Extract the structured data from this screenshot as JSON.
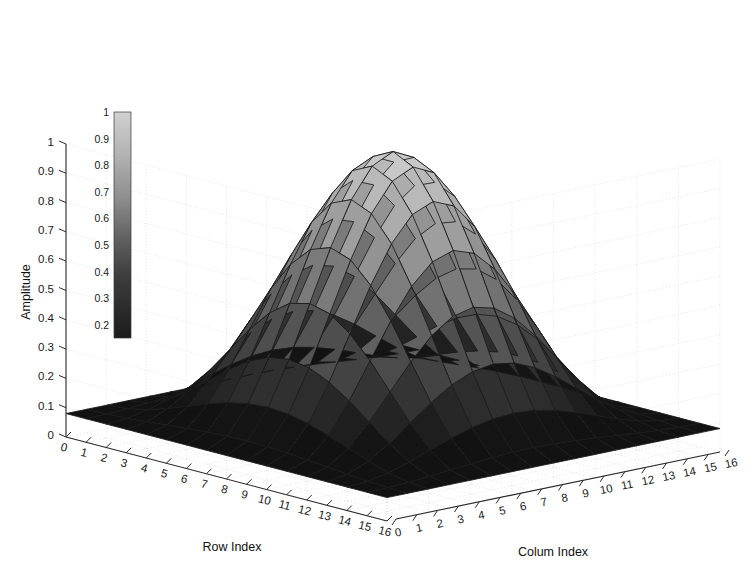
{
  "chart_data": {
    "type": "surface",
    "title": "",
    "xlabel": "Row Index",
    "ylabel": "Colum Index",
    "zlabel": "Amplitude",
    "xlim": [
      0,
      16
    ],
    "ylim": [
      0,
      16
    ],
    "zlim": [
      0,
      1
    ],
    "grid": true,
    "colormap": "gray",
    "shading": "faceted",
    "mesh_edge_color": "#1a1a1a",
    "x_tick_labels": [
      "0",
      "1",
      "2",
      "3",
      "4",
      "5",
      "6",
      "7",
      "8",
      "9",
      "10",
      "11",
      "12",
      "13",
      "14",
      "15",
      "16"
    ],
    "y_tick_labels": [
      "0",
      "1",
      "2",
      "3",
      "4",
      "5",
      "6",
      "7",
      "8",
      "9",
      "10",
      "11",
      "12",
      "13",
      "14",
      "15",
      "16"
    ],
    "z_tick_labels": [
      "0",
      "0.1",
      "0.2",
      "0.3",
      "0.4",
      "0.5",
      "0.6",
      "0.7",
      "0.8",
      "0.9",
      "1"
    ],
    "z_tick_values": [
      0,
      0.1,
      0.2,
      0.3,
      0.4,
      0.5,
      0.6,
      0.7,
      0.8,
      0.9,
      1
    ],
    "x": [
      0,
      1,
      2,
      3,
      4,
      5,
      6,
      7,
      8,
      9,
      10,
      11,
      12,
      13,
      14,
      15,
      16
    ],
    "y": [
      0,
      1,
      2,
      3,
      4,
      5,
      6,
      7,
      8,
      9,
      10,
      11,
      12,
      13,
      14,
      15,
      16
    ],
    "row_window": [
      0.3333,
      0.3576,
      0.4286,
      0.54,
      0.6806,
      0.8361,
      0.9905,
      1.1277,
      1.2333,
      1.2963,
      1.3103,
      1.2744,
      1.1935,
      1.0778,
      0.9417,
      0.8022,
      0.677
    ],
    "z_matrix_note": "z[i][j] = 0.08 + 0.92 * hann(i) * hann(j), hann(k) = 0.5*(1-cos(2*pi*k/16))",
    "z_peak": 1.0,
    "z_edge": 0.08
  },
  "colorbar": {
    "name": "colorbar",
    "orientation": "vertical",
    "top_color": "#d0d0d0",
    "bottom_color": "#1c1c1c",
    "ticks": [
      "1",
      "0.9",
      "0.8",
      "0.7",
      "0.6",
      "0.5",
      "0.4",
      "0.3",
      "0.2"
    ],
    "tick_values": [
      1,
      0.9,
      0.8,
      0.7,
      0.6,
      0.5,
      0.4,
      0.3,
      0.2
    ],
    "range": [
      0.15,
      1.0
    ]
  },
  "axes": {
    "z": {
      "title": "Amplitude",
      "ticks": [
        "1",
        "0.9",
        "0.8",
        "0.7",
        "0.6",
        "0.5",
        "0.4",
        "0.3",
        "0.2",
        "0.1",
        "0"
      ]
    },
    "x": {
      "title": "Row Index",
      "ticks": [
        "0",
        "1",
        "2",
        "3",
        "4",
        "5",
        "6",
        "7",
        "8",
        "9",
        "10",
        "11",
        "12",
        "13",
        "14",
        "15",
        "16"
      ]
    },
    "y": {
      "title": "Colum Index",
      "ticks": [
        "0",
        "1",
        "2",
        "3",
        "4",
        "5",
        "6",
        "7",
        "8",
        "9",
        "10",
        "11",
        "12",
        "13",
        "14",
        "15",
        "16"
      ]
    }
  },
  "style": {
    "background": "#ffffff",
    "grid_color": "#cfcfcf",
    "axis_color": "#2b2b2b",
    "text_color": "#1a1a1a"
  }
}
